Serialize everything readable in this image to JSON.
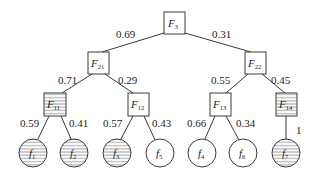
{
  "diagram": {
    "type": "probability-tree",
    "root": {
      "label": "F",
      "sub": "3"
    },
    "level1": [
      {
        "label": "F",
        "sub": "21",
        "prob": "0.69",
        "striped": false
      },
      {
        "label": "F",
        "sub": "22",
        "prob": "0.31",
        "striped": false
      }
    ],
    "level2": [
      {
        "label": "F",
        "sub": "11",
        "parent": "F21",
        "prob": "0.71",
        "striped": true
      },
      {
        "label": "F",
        "sub": "12",
        "parent": "F21",
        "prob": "0.29",
        "striped": false
      },
      {
        "label": "F",
        "sub": "13",
        "parent": "F22",
        "prob": "0.55",
        "striped": false
      },
      {
        "label": "F",
        "sub": "14",
        "parent": "F22",
        "prob": "0.45",
        "striped": true
      }
    ],
    "leaves": [
      {
        "label": "f",
        "sub": "1",
        "parent": "F11",
        "prob": "0.59",
        "striped": true
      },
      {
        "label": "f",
        "sub": "2",
        "parent": "F11",
        "prob": "0.41",
        "striped": true
      },
      {
        "label": "f",
        "sub": "3",
        "parent": "F12",
        "prob": "0.57",
        "striped": true
      },
      {
        "label": "f",
        "sub": "5",
        "parent": "F12",
        "prob": "0.43",
        "striped": false
      },
      {
        "label": "f",
        "sub": "4",
        "parent": "F13",
        "prob": "0.66",
        "striped": false
      },
      {
        "label": "f",
        "sub": "6",
        "parent": "F13",
        "prob": "0.34",
        "striped": false
      },
      {
        "label": "f",
        "sub": "7",
        "parent": "F14",
        "prob": "1",
        "striped": true
      }
    ]
  }
}
